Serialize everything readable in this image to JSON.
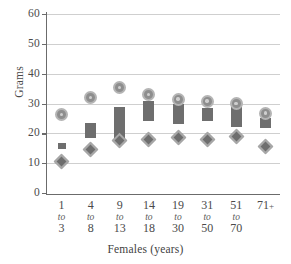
{
  "chart_data": {
    "type": "scatter",
    "title": "",
    "xlabel": "Females (years)",
    "ylabel": "Grams",
    "ylim": [
      0,
      60
    ],
    "yticks": [
      0,
      10,
      20,
      30,
      40,
      50,
      60
    ],
    "grid": true,
    "legend": "none",
    "categories": [
      "1 to 3",
      "4 to 8",
      "9 to 13",
      "14 to 18",
      "19 to 30",
      "31 to 50",
      "51 to 70",
      "71 +"
    ],
    "category_parts": [
      {
        "lo": "1",
        "to": "to",
        "hi": "3"
      },
      {
        "lo": "4",
        "to": "to",
        "hi": "8"
      },
      {
        "lo": "9",
        "to": "to",
        "hi": "13"
      },
      {
        "lo": "14",
        "to": "to",
        "hi": "18"
      },
      {
        "lo": "19",
        "to": "to",
        "hi": "30"
      },
      {
        "lo": "31",
        "to": "to",
        "hi": "50"
      },
      {
        "lo": "51",
        "to": "to",
        "hi": "70"
      },
      {
        "lo": "71",
        "to": "+",
        "hi": ""
      }
    ],
    "series": [
      {
        "name": "upper-circle-marker",
        "marker": "circle",
        "values": [
          26.2,
          32.0,
          35.3,
          33.0,
          31.5,
          30.8,
          30.0,
          26.8
        ]
      },
      {
        "name": "range-bar-top",
        "marker": "bar",
        "values": [
          16.3,
          23.6,
          28.8,
          31.0,
          30.0,
          28.5,
          28.8,
          25.2
        ]
      },
      {
        "name": "range-bar-bottom",
        "marker": "bar",
        "values": [
          15.3,
          18.5,
          17.0,
          24.0,
          23.2,
          24.0,
          22.0,
          21.8
        ]
      },
      {
        "name": "lower-diamond-marker",
        "marker": "diamond",
        "values": [
          10.4,
          14.6,
          17.6,
          18.0,
          18.7,
          18.0,
          19.1,
          15.6
        ]
      }
    ],
    "colors": {
      "bar": "#6e6e6e",
      "circle_fill": "#8e8e8e",
      "circle_ring": "#b4b4b4",
      "diamond_fill": "#6e6e6e",
      "diamond_ring": "#a8a8a8",
      "grid": "#cfcfcf",
      "axis": "#6b6b6b",
      "text": "#4a4a4a",
      "background": "#ffffff"
    }
  }
}
